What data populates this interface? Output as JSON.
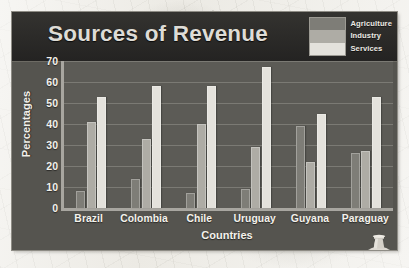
{
  "chart_data": {
    "type": "bar",
    "title": "Sources of Revenue",
    "xlabel": "Countries",
    "ylabel": "Percentages",
    "categories": [
      "Brazil",
      "Colombia",
      "Chile",
      "Uruguay",
      "Guyana",
      "Paraguay"
    ],
    "series": [
      {
        "name": "Agriculture",
        "color": "#7e7d77",
        "values": [
          8,
          14,
          7,
          9,
          39,
          26
        ]
      },
      {
        "name": "Industry",
        "color": "#aeaca5",
        "values": [
          41,
          33,
          40,
          29,
          22,
          27
        ]
      },
      {
        "name": "Services",
        "color": "#e4e2dc",
        "values": [
          53,
          58,
          58,
          67,
          45,
          53
        ]
      }
    ],
    "ylim": [
      0,
      70
    ],
    "yticks": [
      70,
      60,
      50,
      40,
      30,
      20,
      10,
      0
    ],
    "ytick_labels": [
      "70",
      "60",
      "50",
      "40",
      "30",
      "20",
      "10",
      "0"
    ],
    "grid": true,
    "legend_position": "top-right",
    "legend_entries": [
      "Agriculture",
      "Industry",
      "Services"
    ]
  },
  "figure": {
    "panel_background": "#5c5b56",
    "header_background": "#2b2a28",
    "axis_color": "#a8a6a0",
    "gridline_color": "#7b7a74",
    "text_color": "#f3f1eb",
    "page_background": "#edebe5"
  },
  "ornament": {
    "name": "stone-column-icon"
  }
}
